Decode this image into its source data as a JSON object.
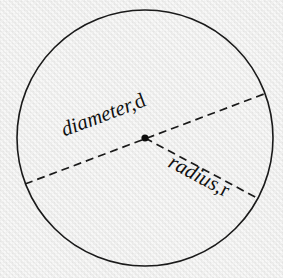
{
  "figure": {
    "type": "geometry-diagram",
    "background_color": "#f1f1f0",
    "stroke_color": "#1a1a1a",
    "circle": {
      "name": "circle-outline",
      "center_x": 145,
      "center_y": 138,
      "radius": 128,
      "stroke_width": 1.6,
      "fill": "none"
    },
    "center_point": {
      "name": "center-dot",
      "x": 145,
      "y": 138,
      "radius": 3.6,
      "fill": "#0c0c0c"
    },
    "diameter_line": {
      "name": "diameter-dashed-line",
      "x1": 25,
      "y1": 184,
      "x2": 264,
      "y2": 94,
      "dash": "8 5",
      "stroke_width": 1.7
    },
    "radius_line": {
      "name": "radius-dashed-line",
      "x1": 145,
      "y1": 138,
      "x2": 257,
      "y2": 198,
      "dash": "8 5",
      "stroke_width": 1.7
    },
    "labels": {
      "diameter": {
        "word": "diameter,",
        "symbol": "d",
        "rotation_deg": -20.6
      },
      "radius": {
        "word": "radius,",
        "symbol": "r",
        "rotation_deg": 28
      }
    }
  }
}
